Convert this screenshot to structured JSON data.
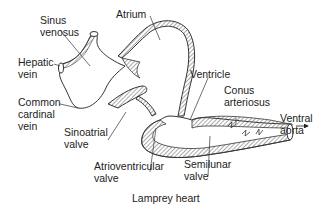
{
  "title": "Lamprey heart",
  "labels": {
    "sinus_venosus": "Sinus\nvenosus",
    "atrium": "Atrium",
    "hepatic_vein": "Hepatic\nvein",
    "ventricle": "Ventricle",
    "conus_arteriosus": "Conus\narteriosus",
    "common_cardinal_vein": "Common\ncardinal\nvein",
    "sinoatrial_valve": "Sinoatrial\nvalve",
    "ventral_aorta": "Ventral\naorta",
    "atrioventricular_valve": "Atrioventricular\nvalve",
    "semilunar_valve": "Semilunar\nvalve"
  },
  "colors": {
    "line": "#333333",
    "hatch": "#555555",
    "text": "#222222"
  }
}
